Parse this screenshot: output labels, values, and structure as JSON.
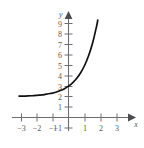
{
  "chart_data": {
    "type": "line",
    "title": "",
    "subtitle": "",
    "xlabel": "x",
    "ylabel": "y",
    "xlim": [
      -3.4,
      3.6
    ],
    "ylim": [
      -1.4,
      9.6
    ],
    "grid": false,
    "legend": null,
    "x_ticks": [
      -3,
      -2,
      -1,
      1,
      2,
      3
    ],
    "x_tick_labels": [
      "−3",
      "−2",
      "−1",
      "1",
      "2",
      "3"
    ],
    "y_ticks": [
      -1,
      1,
      2,
      3,
      4,
      5,
      6,
      7,
      8,
      9
    ],
    "y_tick_labels": [
      "−1",
      "1",
      "2",
      "3",
      "4",
      "5",
      "6",
      "7",
      "8",
      "9"
    ],
    "series": [
      {
        "name": "exponential-curve",
        "color": "#111111",
        "equation": "y = 3^x + 2",
        "asymptote": 2,
        "x": [
          -3.05,
          -2.75,
          -2.5,
          -2.25,
          -2,
          -1.75,
          -1.5,
          -1.25,
          -1,
          -0.75,
          -0.5,
          -0.25,
          0,
          0.25,
          0.5,
          0.75,
          1,
          1.25,
          1.5,
          1.75,
          2.0
        ],
        "values": [
          2.04,
          2.05,
          2.06,
          2.08,
          2.11,
          2.15,
          2.19,
          2.27,
          2.33,
          2.44,
          2.58,
          2.76,
          3.0,
          3.32,
          3.73,
          4.28,
          5.0,
          5.95,
          7.2,
          8.85,
          11.0
        ]
      }
    ],
    "axis_color": "#6d6e71",
    "curve_color": "#111111",
    "label_color": "#58585a",
    "background": "#ffffff"
  },
  "axes": {
    "y_axis_label": "y",
    "x_axis_label": "x"
  }
}
